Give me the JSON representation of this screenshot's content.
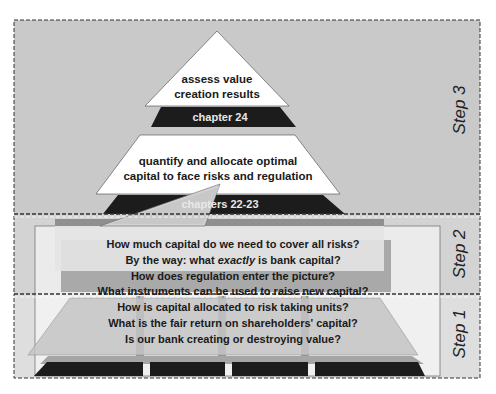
{
  "diagram": {
    "colors": {
      "band_step3": "#c9c9c9",
      "band_step2": "#d4d4d4",
      "band_step1": "#dcdcdc",
      "dark": "#1c1c1c",
      "white": "#ffffff",
      "overlay_gray": "#b4b4b4",
      "overlay_light": "#e2e2e2",
      "frame": "#555555"
    },
    "steps": [
      {
        "label": "Step 3"
      },
      {
        "label": "Step 2"
      },
      {
        "label": "Step 1"
      }
    ],
    "pyramid": {
      "top": {
        "lines": [
          "assess value",
          "creation results"
        ],
        "chapter": "chapter 24"
      },
      "middle": {
        "lines": [
          "quantify and allocate optimal",
          "capital to face risks and regulation"
        ],
        "chapter": "chapters 22-23"
      }
    },
    "questions": {
      "step2": [
        "How much capital do we need to cover all risks?",
        "By the way: what",
        "exactly",
        "is bank capital?",
        "How does regulation enter the picture?",
        "What instruments can be used to raise new capital?"
      ],
      "step1": [
        "How is capital allocated to risk taking units?",
        "What is the fair return on shareholders' capital?",
        "Is our bank creating or destroying value?"
      ]
    }
  }
}
